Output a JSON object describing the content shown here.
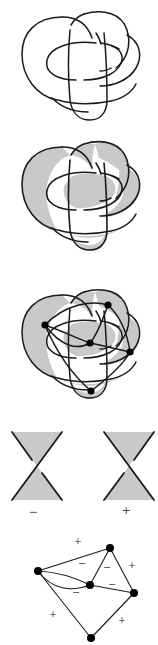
{
  "figure": {
    "background_color": "#ffffff",
    "stroke_color": "#1a1a1a",
    "shade_color": "#c9c9c9",
    "vertex_color": "#000000"
  },
  "panels": [
    {
      "id": "knot",
      "name": "knot-diagram",
      "caption": "",
      "description": "Unshaded knot projection with six crossings"
    },
    {
      "id": "shaded",
      "name": "checkerboard-shaded-knot",
      "caption": "",
      "description": "Same knot projection with checkerboard shading of regions"
    },
    {
      "id": "graph-overlay",
      "name": "shaded-knot-with-graph-overlay",
      "caption": "",
      "description": "Shaded knot with dual graph vertices and edges superimposed"
    },
    {
      "id": "crossing-signs",
      "name": "crossing-sign-convention",
      "caption": "",
      "description": "Two shaded crossings illustrating negative and positive signs"
    },
    {
      "id": "signed-graph",
      "name": "signed-planar-graph",
      "caption": "",
      "description": "Resulting signed planar graph with five vertices and eight edges"
    }
  ],
  "crossing_signs": {
    "negative": {
      "label": "−",
      "x": 33,
      "y": 112,
      "name": "negative-crossing-label"
    },
    "positive": {
      "label": "+",
      "x": 126,
      "y": 112,
      "name": "positive-crossing-label"
    }
  },
  "graph": {
    "vertex_count": 5,
    "edge_count": 8,
    "vertices": [
      {
        "id": "v-left",
        "x": 38,
        "y": 43
      },
      {
        "id": "v-top",
        "x": 110,
        "y": 20
      },
      {
        "id": "v-center",
        "x": 90,
        "y": 57
      },
      {
        "id": "v-right",
        "x": 134,
        "y": 65
      },
      {
        "id": "v-bottom",
        "x": 91,
        "y": 110
      }
    ],
    "edges": [
      {
        "id": "e1",
        "from": "v-left",
        "to": "v-top",
        "sign": "+",
        "label_x": 78,
        "label_y": 18
      },
      {
        "id": "e2",
        "from": "v-left",
        "to": "v-center",
        "sign": "−",
        "label_x": 82,
        "label_y": 38,
        "curve": "upper"
      },
      {
        "id": "e3",
        "from": "v-left",
        "to": "v-center",
        "sign": "−",
        "label_x": 76,
        "label_y": 66,
        "curve": "lower"
      },
      {
        "id": "e4",
        "from": "v-top",
        "to": "v-center",
        "sign": "−",
        "label_x": 106,
        "label_y": 40
      },
      {
        "id": "e5",
        "from": "v-top",
        "to": "v-right",
        "sign": "+",
        "label_x": 130,
        "label_y": 40
      },
      {
        "id": "e6",
        "from": "v-center",
        "to": "v-right",
        "sign": "−",
        "label_x": 110,
        "label_y": 57
      },
      {
        "id": "e7",
        "from": "v-left",
        "to": "v-bottom",
        "sign": "+",
        "label_x": 55,
        "label_y": 88
      },
      {
        "id": "e8",
        "from": "v-bottom",
        "to": "v-right",
        "sign": "+",
        "label_x": 122,
        "label_y": 93
      }
    ],
    "sign_labels": [
      "+",
      "−",
      "−",
      "−",
      "+",
      "−",
      "+",
      "+"
    ]
  },
  "overlay_vertices": [
    {
      "id": "ov-left",
      "x": 45,
      "y": 65
    },
    {
      "id": "ov-top",
      "x": 108,
      "y": 45
    },
    {
      "id": "ov-center",
      "x": 90,
      "y": 83
    },
    {
      "id": "ov-right",
      "x": 130,
      "y": 92
    },
    {
      "id": "ov-bottom",
      "x": 91,
      "y": 131
    }
  ]
}
